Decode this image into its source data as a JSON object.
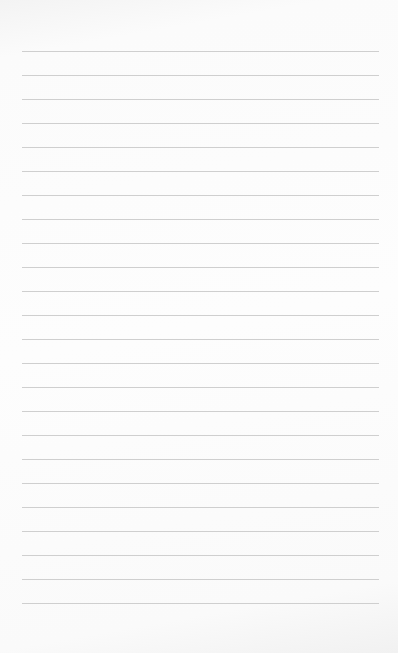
{
  "notepad": {
    "line_count": 24,
    "first_line_y": 51,
    "line_spacing": 24,
    "line_color": "#cfcfcf",
    "paper_color": "#fdfdfd",
    "text": ""
  }
}
